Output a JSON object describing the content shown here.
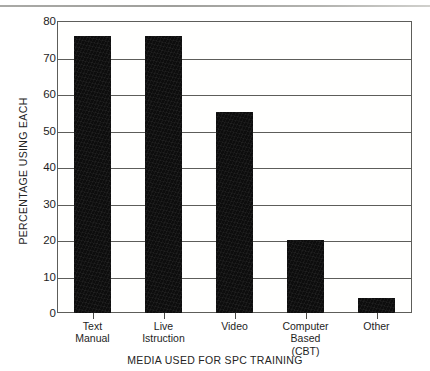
{
  "chart_data": {
    "type": "bar",
    "title": "",
    "xlabel": "MEDIA USED FOR SPC TRAINING",
    "ylabel": "PERCENTAGE USING EACH",
    "categories": [
      "Text Manual",
      "Live Istruction",
      "Video",
      "Computer Based (CBT)",
      "Other"
    ],
    "category_lines": [
      [
        "Text",
        "Manual"
      ],
      [
        "Live",
        "Istruction"
      ],
      [
        "Video"
      ],
      [
        "Computer",
        "Based",
        "(CBT)"
      ],
      [
        "Other"
      ]
    ],
    "values": [
      76,
      76,
      55,
      20,
      4
    ],
    "ylim": [
      0,
      80
    ],
    "ytick_step": 10,
    "yticks": [
      0,
      10,
      20,
      30,
      40,
      50,
      60,
      70,
      80
    ],
    "grid": true,
    "legend": false,
    "bar_color": "#0d0d0d",
    "axis_color": "#5d5d5a",
    "background_color": "#ffffff"
  }
}
